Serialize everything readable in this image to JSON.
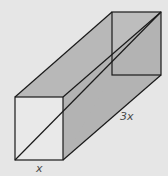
{
  "diagram": {
    "type": "rectangular-prism",
    "labels": {
      "length": "3x",
      "width": "x"
    },
    "colors": {
      "background": "#e6e6e6",
      "front_face": "#e9e9e9",
      "top_face": "#b8b8b8",
      "side_face": "#b3b3b3",
      "back_face": "#bdbdbd",
      "edge": "#1a1a1a"
    },
    "vertices": {
      "front_top_left": [
        15,
        97
      ],
      "front_top_right": [
        63,
        97
      ],
      "front_bottom_left": [
        15,
        160
      ],
      "front_bottom_right": [
        63,
        160
      ],
      "back_top_left": [
        112,
        12
      ],
      "back_top_right": [
        161,
        12
      ],
      "back_bottom_left": [
        112,
        75
      ],
      "back_bottom_right": [
        161,
        75
      ]
    }
  }
}
